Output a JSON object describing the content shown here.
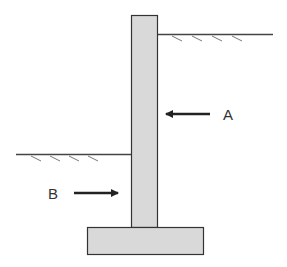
{
  "diagram": {
    "type": "retaining-wall",
    "labels": {
      "a": "A",
      "b": "B"
    },
    "colors": {
      "concrete_fill": "#d9d9d9",
      "outline": "#333333",
      "arrow": "#222222",
      "hatch": "#666666",
      "background": "#ffffff"
    },
    "components": {
      "stem": "vertical wall stem",
      "footing": "base footing",
      "ground_high": "retained soil surface (right side)",
      "ground_low": "front soil surface (left side)",
      "arrow_a": "force arrow pointing left toward wall",
      "arrow_b": "force arrow pointing right toward wall"
    }
  }
}
